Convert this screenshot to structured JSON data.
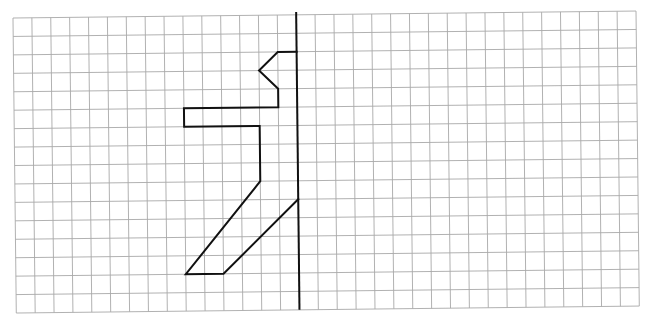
{
  "worksheet": {
    "type": "symmetry-grid",
    "grid": {
      "columns": 33,
      "rows": 16,
      "origin_px": [
        13,
        18
      ],
      "cell_width_px": 18.88,
      "cell_height_px": 18.44,
      "rotation_deg": -0.64,
      "line_color": "#a8a8a8"
    },
    "mirror_axis": {
      "orientation": "vertical",
      "column": 15,
      "from_row": -0.15,
      "to_row": 16,
      "color": "#111111"
    },
    "half_figure": {
      "color": "#111111",
      "points_grid": [
        [
          15,
          2
        ],
        [
          14,
          2
        ],
        [
          13,
          3
        ],
        [
          14,
          4
        ],
        [
          14,
          5
        ],
        [
          9,
          5
        ],
        [
          9,
          6
        ],
        [
          13,
          6
        ],
        [
          13,
          9
        ],
        [
          9,
          14
        ],
        [
          11,
          14
        ],
        [
          15,
          10
        ]
      ]
    }
  }
}
